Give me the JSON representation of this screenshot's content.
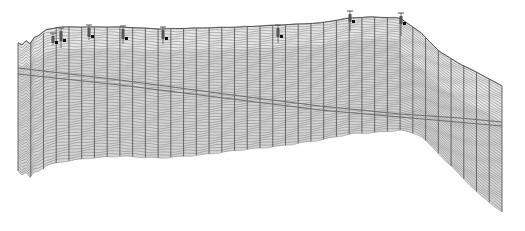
{
  "diagram": {
    "type": "3d-geological-fence-mesh",
    "colors": {
      "background": "#ffffff",
      "mesh_fill": "#d4d4d4",
      "mesh_fill_light": "#e6e6e6",
      "row_line": "#8a8a8a",
      "column_line": "#5a5a5a",
      "horizon_line": "#6e6e6e",
      "well": "#555555",
      "well_marker": "#111111"
    },
    "top_profile": [
      [
        18,
        44
      ],
      [
        30,
        42
      ],
      [
        45,
        30
      ],
      [
        60,
        27
      ],
      [
        90,
        27
      ],
      [
        120,
        27
      ],
      [
        160,
        29
      ],
      [
        200,
        28
      ],
      [
        240,
        27
      ],
      [
        280,
        25
      ],
      [
        320,
        23
      ],
      [
        350,
        18
      ],
      [
        370,
        17
      ],
      [
        400,
        18
      ],
      [
        420,
        32
      ],
      [
        440,
        52
      ],
      [
        460,
        64
      ],
      [
        480,
        74
      ],
      [
        502,
        86
      ]
    ],
    "bottom_profile": [
      [
        18,
        172
      ],
      [
        30,
        176
      ],
      [
        45,
        166
      ],
      [
        60,
        162
      ],
      [
        90,
        158
      ],
      [
        120,
        156
      ],
      [
        160,
        158
      ],
      [
        200,
        155
      ],
      [
        240,
        150
      ],
      [
        280,
        146
      ],
      [
        320,
        140
      ],
      [
        350,
        134
      ],
      [
        380,
        132
      ],
      [
        400,
        130
      ],
      [
        420,
        135
      ],
      [
        440,
        155
      ],
      [
        460,
        175
      ],
      [
        480,
        195
      ],
      [
        502,
        212
      ]
    ],
    "columns": 38,
    "rows": 48,
    "shade_boundary_offset": 22,
    "horizon_line": [
      [
        18,
        68
      ],
      [
        120,
        80
      ],
      [
        240,
        96
      ],
      [
        320,
        106
      ],
      [
        400,
        114
      ],
      [
        460,
        118
      ],
      [
        502,
        122
      ]
    ],
    "horizon_line_2": [
      [
        18,
        74
      ],
      [
        120,
        85
      ],
      [
        240,
        100
      ],
      [
        320,
        110
      ],
      [
        400,
        117
      ],
      [
        502,
        126
      ]
    ],
    "wells": [
      {
        "x": 53,
        "top": 33,
        "bottom": 45,
        "marker_y": 42
      },
      {
        "x": 61,
        "top": 28,
        "bottom": 48,
        "marker_y": 40
      },
      {
        "x": 89,
        "top": 25,
        "bottom": 40,
        "marker_y": 36
      },
      {
        "x": 123,
        "top": 26,
        "bottom": 44,
        "marker_y": 38
      },
      {
        "x": 163,
        "top": 27,
        "bottom": 44,
        "marker_y": 38
      },
      {
        "x": 278,
        "top": 25,
        "bottom": 43,
        "marker_y": 36
      },
      {
        "x": 350,
        "top": 11,
        "bottom": 31,
        "marker_y": 21
      },
      {
        "x": 401,
        "top": 13,
        "bottom": 36,
        "marker_y": 23
      }
    ]
  }
}
